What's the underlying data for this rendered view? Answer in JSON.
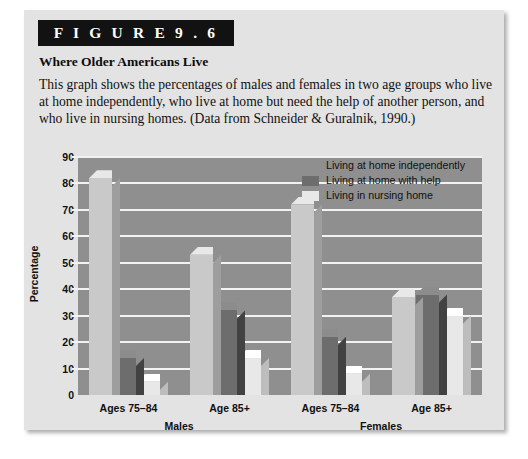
{
  "figure": {
    "banner_label": "F I G U R E   9 . 6",
    "title": "Where Older Americans Live",
    "caption": "This graph shows the percentages of males and females in two age groups who live at home independently, who live at home but need the help of another person, and who live in nursing homes. (Data from Schneider & Guralnik, 1990.)"
  },
  "colors": {
    "card_background": "#e3e3e3",
    "banner": "#121212",
    "plot_background": "#8f8f8f",
    "gridline": "#f2f2f2",
    "series_independent": "#c9c9c9",
    "series_with_help": "#6d6d6d",
    "series_nursing": "#e8e8e8"
  },
  "chart_data": {
    "type": "bar",
    "title": "Where Older Americans Live",
    "xlabel": "",
    "ylabel": "Percentage",
    "ylim": [
      0,
      90
    ],
    "yticks": [
      0,
      10,
      20,
      30,
      40,
      50,
      60,
      70,
      80,
      90
    ],
    "grid": true,
    "legend_position": "top-right",
    "categories": [
      "Ages 75–84",
      "Age 85+",
      "Ages 75–84",
      "Age 85+"
    ],
    "groups": [
      {
        "name": "Males",
        "categories": [
          "Ages 75–84",
          "Age 85+"
        ]
      },
      {
        "name": "Females",
        "categories": [
          "Ages 75–84",
          "Age 85+"
        ]
      }
    ],
    "series": [
      {
        "name": "Living at home independently",
        "color": "#c9c9c9",
        "values": [
          82,
          53,
          72,
          37
        ]
      },
      {
        "name": "Living at home with help",
        "color": "#6d6d6d",
        "values": [
          14,
          32,
          22,
          38
        ]
      },
      {
        "name": "Living in nursing home",
        "color": "#e8e8e8",
        "values": [
          5,
          14,
          8,
          30
        ]
      }
    ]
  }
}
